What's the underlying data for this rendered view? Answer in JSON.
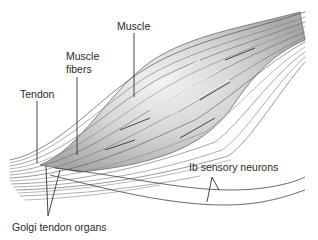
{
  "diagram": {
    "labels": {
      "muscle": "Muscle",
      "muscle_fibers_line1": "Muscle",
      "muscle_fibers_line2": "fibers",
      "tendon": "Tendon",
      "ib_sensory_neurons": "Ib sensory neurons",
      "golgi_tendon_organs": "Golgi tendon organs"
    },
    "colors": {
      "background": "#ffffff",
      "fiber_dark": "#5a5a5a",
      "fiber_mid": "#8c8c8c",
      "belly_fill": "#cfcfcf",
      "belly_highlight": "#ececec",
      "leader_line": "#333333",
      "text": "#2a2a2a"
    }
  }
}
